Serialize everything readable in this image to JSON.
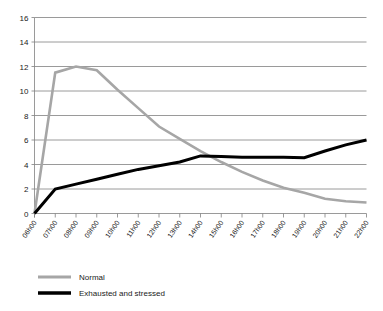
{
  "chart_data": {
    "type": "line",
    "title": "",
    "subtitle": "",
    "xlabel": "",
    "ylabel": "",
    "ylim": [
      0,
      16
    ],
    "ytick_values": [
      0,
      2,
      4,
      6,
      8,
      10,
      12,
      14,
      16
    ],
    "ytick_labels": [
      "0",
      "2",
      "4",
      "6",
      "8",
      "10",
      "12",
      "14",
      "16"
    ],
    "grid": true,
    "legend_position": "bottom-left",
    "categories": [
      "06h00",
      "07h00",
      "08h00",
      "09h00",
      "10h00",
      "11h00",
      "12h00",
      "13h00",
      "14h00",
      "15h00",
      "16h00",
      "17h00",
      "18h00",
      "19h00",
      "20h00",
      "21h00",
      "22h00"
    ],
    "series": [
      {
        "name": "Normal",
        "color": "#a6a6a6",
        "values": [
          0,
          11.5,
          12,
          11.7,
          10.1,
          8.6,
          7.1,
          6.1,
          5.1,
          4.2,
          3.4,
          2.7,
          2.1,
          1.7,
          1.2,
          1.0,
          0.9
        ]
      },
      {
        "name": "Exhausted and stressed",
        "color": "#000000",
        "values": [
          0,
          2,
          2.4,
          2.8,
          3.2,
          3.6,
          3.9,
          4.2,
          4.7,
          4.65,
          4.6,
          4.6,
          4.6,
          4.55,
          5.1,
          5.6,
          6
        ]
      }
    ],
    "legend": [
      {
        "label": "Normal",
        "color": "#a6a6a6"
      },
      {
        "label": "Exhausted and stressed",
        "color": "#000000"
      }
    ]
  }
}
